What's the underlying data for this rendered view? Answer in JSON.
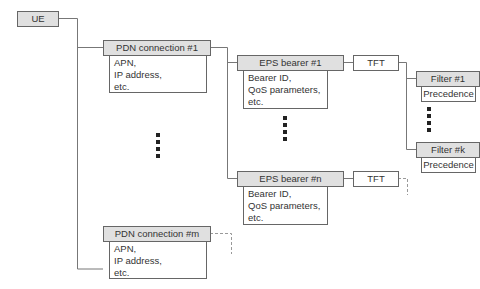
{
  "diagram": {
    "ue": {
      "label": "UE"
    },
    "pdn_connections": [
      {
        "label": "PDN connection #1",
        "details": "APN,\nIP address,\netc."
      },
      {
        "label": "PDN connection #m",
        "details": "APN,\nIP address,\netc."
      }
    ],
    "eps_bearers": [
      {
        "label": "EPS bearer #1",
        "details": "Bearer ID,\nQoS parameters,\netc.",
        "tft": "TFT"
      },
      {
        "label": "EPS bearer #n",
        "details": "Bearer ID,\nQoS parameters,\netc.",
        "tft": "TFT"
      }
    ],
    "filters": [
      {
        "label": "Filter #1",
        "details": "Precedence"
      },
      {
        "label": "Filter #k",
        "details": "Precedence"
      }
    ],
    "colors": {
      "header_fill": "#e0e0e0",
      "line": "#777777",
      "border": "#666666",
      "dashed": "#999999"
    }
  }
}
